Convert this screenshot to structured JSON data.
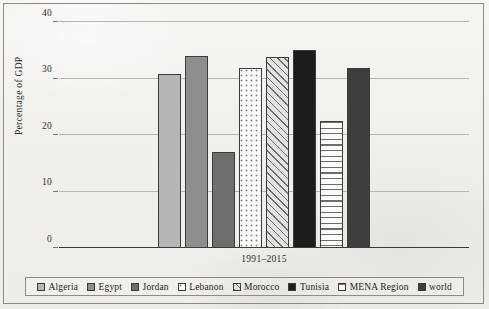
{
  "chart_data": {
    "type": "bar",
    "title": "",
    "xlabel": "",
    "ylabel": "Percentage of GDP",
    "categories": [
      "1991–2015"
    ],
    "ylim": [
      0,
      40
    ],
    "yticks": [
      0,
      10,
      20,
      30,
      40
    ],
    "ytick_labels": [
      "0",
      "10",
      "20",
      "30",
      "40"
    ],
    "grid": true,
    "legend_position": "bottom",
    "series": [
      {
        "name": "Algeria",
        "values": [
          30.8
        ],
        "pattern": "solid-light-gray",
        "color": "#b6b6b6"
      },
      {
        "name": "Egypt",
        "values": [
          34.0
        ],
        "pattern": "solid-medium-gray",
        "color": "#8e8e8e"
      },
      {
        "name": "Jordan",
        "values": [
          17.0
        ],
        "pattern": "solid-dark-gray",
        "color": "#6e6e6e"
      },
      {
        "name": "Lebanon",
        "values": [
          31.8
        ],
        "pattern": "dotted",
        "color": "#fbfbfa"
      },
      {
        "name": "Morocco",
        "values": [
          33.8
        ],
        "pattern": "diagonal-hatch",
        "color": "#e3e3e1"
      },
      {
        "name": "Tunisia",
        "values": [
          35.0
        ],
        "pattern": "solid-black",
        "color": "#1c1c1c"
      },
      {
        "name": "MENA Region",
        "values": [
          22.5
        ],
        "pattern": "horizontal-lines",
        "color": "#fbfbfa"
      },
      {
        "name": "world",
        "values": [
          31.8
        ],
        "pattern": "solid-deep-gray",
        "color": "#3e3e3e"
      }
    ]
  },
  "axes": {
    "y_axis_title": "Percentage of GDP",
    "x_category_label": "1991–2015"
  }
}
